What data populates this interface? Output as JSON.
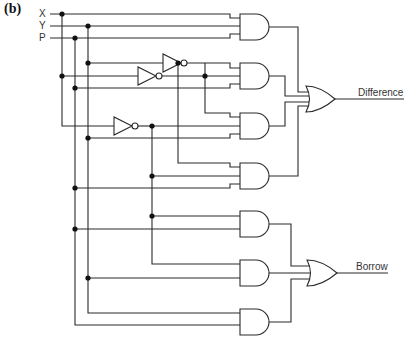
{
  "figure": {
    "panel_label": "(b)",
    "inputs": [
      "X",
      "Y",
      "P"
    ],
    "outputs": {
      "difference": "Difference",
      "borrow": "Borrow"
    },
    "gates": {
      "not_gates": 3,
      "and_gates": 7,
      "or_gates": 2
    },
    "colors": {
      "line": "#2a2a2a",
      "background": "#ffffff"
    }
  }
}
